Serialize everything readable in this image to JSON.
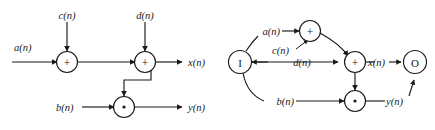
{
  "figure": {
    "stroke_color": "#1a1a1a",
    "background_color": "#ffffff"
  },
  "left_diagram": {
    "name": "block-diagram",
    "inputs": [
      {
        "id": "a",
        "label": "a(n)"
      },
      {
        "id": "b",
        "label": "b(n)"
      },
      {
        "id": "c",
        "label": "c(n)"
      },
      {
        "id": "d",
        "label": "d(n)"
      }
    ],
    "outputs": [
      {
        "id": "x",
        "label": "x(n)"
      },
      {
        "id": "y",
        "label": "y(n)"
      }
    ],
    "operators": [
      {
        "id": "add1",
        "glyph": "+",
        "type": "adder"
      },
      {
        "id": "add2",
        "glyph": "+",
        "type": "adder"
      },
      {
        "id": "mul1",
        "glyph": "*",
        "type": "multiplier"
      }
    ]
  },
  "right_diagram": {
    "name": "dependence-graph",
    "nodes": [
      {
        "id": "in",
        "glyph": "I",
        "type": "input-node"
      },
      {
        "id": "add_top",
        "glyph": "+",
        "type": "adder"
      },
      {
        "id": "add_mid",
        "glyph": "+",
        "type": "adder"
      },
      {
        "id": "mul",
        "glyph": "*",
        "type": "multiplier"
      },
      {
        "id": "out",
        "glyph": "O",
        "type": "output-node"
      }
    ],
    "edge_labels": [
      {
        "id": "a",
        "label": "a(n)"
      },
      {
        "id": "c",
        "label": "c(n)"
      },
      {
        "id": "d",
        "label": "d(n)"
      },
      {
        "id": "b",
        "label": "b(n)"
      },
      {
        "id": "x",
        "label": "x(n)"
      },
      {
        "id": "y",
        "label": "y(n)"
      }
    ]
  }
}
